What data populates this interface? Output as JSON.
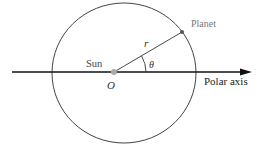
{
  "diagram": {
    "labels": {
      "planet": "Planet",
      "sun": "Sun",
      "radius": "r",
      "angle": "θ",
      "origin": "O",
      "polar_axis": "Polar axis"
    },
    "colors": {
      "stroke": "#333333",
      "sun": "#aaaaaa",
      "planet": "#555555"
    },
    "geometry": {
      "orbit_center": [
        124,
        73
      ],
      "orbit_radii": [
        72,
        70
      ],
      "sun": [
        114,
        72
      ],
      "planet": [
        182,
        32
      ],
      "axis": {
        "from": [
          12,
          72
        ],
        "to": [
          252,
          72
        ]
      }
    }
  }
}
